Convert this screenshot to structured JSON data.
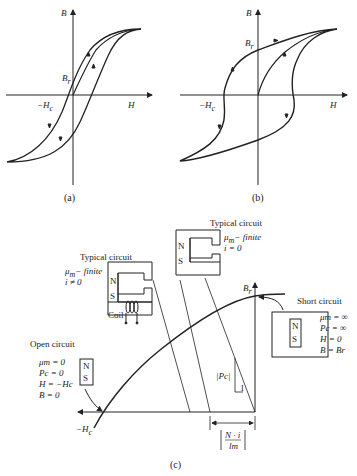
{
  "panel_a": {
    "caption": "(a)",
    "axis_y": "B",
    "axis_x": "H",
    "remanence_label": "B",
    "remanence_sub": "r",
    "coercive_label": "−H",
    "coercive_sub": "c",
    "curve": "narrow hysteresis loop (soft magnetic material)"
  },
  "panel_b": {
    "caption": "(b)",
    "axis_y": "B",
    "axis_x": "H",
    "remanence_label": "B",
    "remanence_sub": "r",
    "coercive_label": "−H",
    "coercive_sub": "c",
    "curve": "wide hysteresis loop (hard magnetic material)"
  },
  "panel_c": {
    "caption": "(c)",
    "br_label": "B",
    "br_sub": "r",
    "hc_label": "−H",
    "hc_sub": "c",
    "typical_circuit_coil": {
      "title": "Typical circuit",
      "line1": "μ",
      "line1_sub": "m",
      "line1_rest": "− finite",
      "line2": "i ≠ 0",
      "pole_n": "N",
      "pole_s": "S",
      "coil_label": "Coil"
    },
    "typical_circuit_gap": {
      "title": "Typical circuit",
      "line1": "μ",
      "line1_sub": "m",
      "line1_rest": "− finite",
      "line2": "i = 0",
      "pole_n": "N",
      "pole_s": "S"
    },
    "open_circuit": {
      "title": "Open circuit",
      "lines": [
        "μm = 0",
        "Pc = 0",
        "H = −Hc",
        "B = 0"
      ],
      "pole_n": "N",
      "pole_s": "S"
    },
    "short_circuit": {
      "title": "Short circuit",
      "lines": [
        "μm = ∞",
        "Pc = ∞",
        "H = 0",
        "B = Br"
      ],
      "pole_n": "N",
      "pole_s": "S"
    },
    "slope_label": "|Pc|",
    "slope_unit": "1",
    "offset_label_num": "N · i",
    "offset_label_den": "lm"
  }
}
